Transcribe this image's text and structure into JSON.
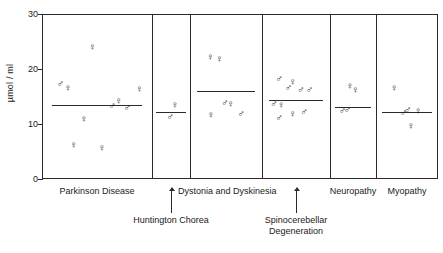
{
  "chart_data": {
    "type": "scatter",
    "title": "",
    "xlabel": "",
    "ylabel": "µmol / ml",
    "ylim": [
      0,
      30
    ],
    "yticks": [
      0,
      10,
      20,
      30
    ],
    "grid": false,
    "legend": "none",
    "marker_semantics": {
      "male": "♂",
      "female": "♀"
    },
    "groups": [
      {
        "name": "Parkinson Disease",
        "label": "Parkinson Disease",
        "label_style": "inline",
        "mean": 13.5,
        "points": [
          {
            "sex": "female",
            "value": 24.0,
            "x": 0.42
          },
          {
            "sex": "male",
            "value": 17.3,
            "x": 0.08
          },
          {
            "sex": "female",
            "value": 16.5,
            "x": 0.16
          },
          {
            "sex": "female",
            "value": 16.4,
            "x": 0.92
          },
          {
            "sex": "female",
            "value": 14.2,
            "x": 0.7
          },
          {
            "sex": "male",
            "value": 13.3,
            "x": 0.63
          },
          {
            "sex": "male",
            "value": 13.0,
            "x": 0.79
          },
          {
            "sex": "female",
            "value": 11.0,
            "x": 0.33
          },
          {
            "sex": "female",
            "value": 6.2,
            "x": 0.22
          },
          {
            "sex": "female",
            "value": 5.6,
            "x": 0.52
          }
        ]
      },
      {
        "name": "Huntington Chorea",
        "label": "Huntington Chorea",
        "label_style": "leader",
        "mean": 12.2,
        "points": [
          {
            "sex": "female",
            "value": 13.4,
            "x": 0.55
          },
          {
            "sex": "male",
            "value": 11.2,
            "x": 0.33
          }
        ]
      },
      {
        "name": "Dystonia and Dyskinesia",
        "label": "Dystonia and Dyskinesia",
        "label_style": "inline",
        "mean": 16.0,
        "points": [
          {
            "sex": "female",
            "value": 22.2,
            "x": 0.17
          },
          {
            "sex": "female",
            "value": 21.9,
            "x": 0.33
          },
          {
            "sex": "male",
            "value": 13.8,
            "x": 0.43
          },
          {
            "sex": "female",
            "value": 13.6,
            "x": 0.53
          },
          {
            "sex": "female",
            "value": 11.7,
            "x": 0.18
          },
          {
            "sex": "male",
            "value": 11.9,
            "x": 0.72
          }
        ]
      },
      {
        "name": "Spinocerebellar Degeneration",
        "label": "Spinocerebellar Degeneration",
        "label_style": "leader",
        "mean": 14.4,
        "points": [
          {
            "sex": "male",
            "value": 18.2,
            "x": 0.12
          },
          {
            "sex": "female",
            "value": 17.6,
            "x": 0.38
          },
          {
            "sex": "male",
            "value": 16.5,
            "x": 0.3
          },
          {
            "sex": "male",
            "value": 16.2,
            "x": 0.54
          },
          {
            "sex": "male",
            "value": 16.1,
            "x": 0.7
          },
          {
            "sex": "male",
            "value": 13.6,
            "x": 0.02
          },
          {
            "sex": "female",
            "value": 13.4,
            "x": 0.16
          },
          {
            "sex": "female",
            "value": 11.8,
            "x": 0.38
          },
          {
            "sex": "male",
            "value": 12.1,
            "x": 0.6
          },
          {
            "sex": "male",
            "value": 11.1,
            "x": 0.12
          }
        ]
      },
      {
        "name": "Neuropathy",
        "label": "Neuropathy",
        "label_style": "inline",
        "mean": 13.1,
        "points": [
          {
            "sex": "female",
            "value": 16.9,
            "x": 0.3
          },
          {
            "sex": "female",
            "value": 16.1,
            "x": 0.48
          },
          {
            "sex": "male",
            "value": 12.3,
            "x": 0.05
          },
          {
            "sex": "male",
            "value": 12.5,
            "x": 0.22
          }
        ]
      },
      {
        "name": "Myopathy",
        "label": "Myopathy",
        "label_style": "inline",
        "mean": 12.2,
        "points": [
          {
            "sex": "female",
            "value": 16.6,
            "x": 0.16
          },
          {
            "sex": "male",
            "value": 12.6,
            "x": 0.45
          },
          {
            "sex": "male",
            "value": 12.0,
            "x": 0.36
          },
          {
            "sex": "female",
            "value": 12.3,
            "x": 0.68
          },
          {
            "sex": "female",
            "value": 9.6,
            "x": 0.52
          }
        ]
      }
    ]
  },
  "axis": {
    "ylabel": "µmol / ml",
    "tick_30": "30",
    "tick_20": "20",
    "tick_10": "10",
    "tick_0": "0"
  }
}
